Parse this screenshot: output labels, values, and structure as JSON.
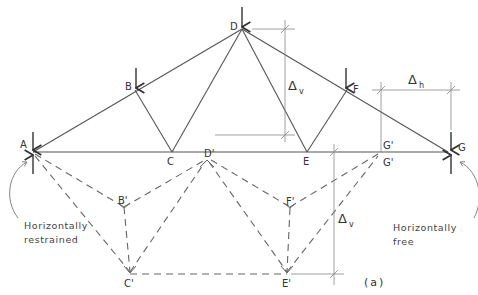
{
  "figure": {
    "label": "(a)",
    "nodes": {
      "A": "A",
      "B": "B",
      "C": "C",
      "D": "D",
      "E": "E",
      "F": "F",
      "G": "G",
      "B_prime": "B'",
      "C_prime": "C'",
      "D_prime": "D'",
      "E_prime": "E'",
      "F_prime": "F'",
      "G_prime_top": "G'",
      "G_prime_bottom": "G'"
    },
    "dimensions": {
      "delta_v_upper": {
        "symbol": "Δ",
        "sub": "v"
      },
      "delta_v_lower": {
        "symbol": "Δ",
        "sub": "v"
      },
      "delta_h": {
        "symbol": "Δ",
        "sub": "h"
      }
    },
    "annotations": {
      "left_support_line1": "Horizontally",
      "left_support_line2": "restrained",
      "right_support_line1": "Horizontally",
      "right_support_line2": "free"
    }
  }
}
